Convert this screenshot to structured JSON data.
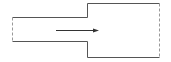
{
  "diagram": {
    "title": "",
    "type": "sudden-pipe-expansion",
    "colors": {
      "wall": "#555555",
      "open_boundary": "#999999",
      "arrow": "#333333",
      "background": "#ffffff"
    },
    "elements": {
      "narrow_section": "narrow-pipe",
      "wide_section": "wide-pipe",
      "inlet": "inlet-boundary",
      "outlet": "outlet-boundary",
      "flow": "flow-direction-arrow"
    }
  }
}
